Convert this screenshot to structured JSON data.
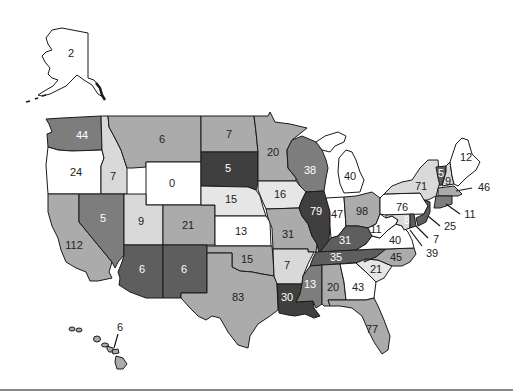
{
  "map": {
    "title": "",
    "palette": {
      "white": "#ffffff",
      "light": "#d9d9d9",
      "medium": "#ababab",
      "dark": "#7d7d7d",
      "darker": "#5e5e5e",
      "darkest": "#3f3f3f",
      "outline": "#1a1a1a"
    },
    "states": {
      "AK": {
        "name": "Alaska",
        "value": "2"
      },
      "HI": {
        "name": "Hawaii",
        "value": "6"
      },
      "WA": {
        "name": "Washington",
        "value": "44"
      },
      "OR": {
        "name": "Oregon",
        "value": "24"
      },
      "CA": {
        "name": "California",
        "value": "112"
      },
      "ID": {
        "name": "Idaho",
        "value": "7"
      },
      "NV": {
        "name": "Nevada",
        "value": "5"
      },
      "MT": {
        "name": "Montana",
        "value": "6"
      },
      "WY": {
        "name": "Wyoming",
        "value": "0"
      },
      "UT": {
        "name": "Utah",
        "value": "9"
      },
      "CO": {
        "name": "Colorado",
        "value": "21"
      },
      "AZ": {
        "name": "Arizona",
        "value": "6"
      },
      "NM": {
        "name": "New Mexico",
        "value": "6"
      },
      "ND": {
        "name": "North Dakota",
        "value": "7"
      },
      "SD": {
        "name": "South Dakota",
        "value": "5"
      },
      "NE": {
        "name": "Nebraska",
        "value": "15"
      },
      "KS": {
        "name": "Kansas",
        "value": "13"
      },
      "OK": {
        "name": "Oklahoma",
        "value": "15"
      },
      "TX": {
        "name": "Texas",
        "value": "83"
      },
      "MN": {
        "name": "Minnesota",
        "value": "20"
      },
      "IA": {
        "name": "Iowa",
        "value": "16"
      },
      "MO": {
        "name": "Missouri",
        "value": "31"
      },
      "AR": {
        "name": "Arkansas",
        "value": "7"
      },
      "LA": {
        "name": "Louisiana",
        "value": "30"
      },
      "WI": {
        "name": "Wisconsin",
        "value": "38"
      },
      "IL": {
        "name": "Illinois",
        "value": "79"
      },
      "MI": {
        "name": "Michigan",
        "value": "40"
      },
      "IN": {
        "name": "Indiana",
        "value": "47"
      },
      "OH": {
        "name": "Ohio",
        "value": "98"
      },
      "KY": {
        "name": "Kentucky",
        "value": "31"
      },
      "TN": {
        "name": "Tennessee",
        "value": "35"
      },
      "MS": {
        "name": "Mississippi",
        "value": "13"
      },
      "AL": {
        "name": "Alabama",
        "value": "20"
      },
      "GA": {
        "name": "Georgia",
        "value": "43"
      },
      "FL": {
        "name": "Florida",
        "value": "77"
      },
      "SC": {
        "name": "South Carolina",
        "value": "21"
      },
      "NC": {
        "name": "North Carolina",
        "value": "45"
      },
      "VA": {
        "name": "Virginia",
        "value": "40"
      },
      "WV": {
        "name": "West Virginia",
        "value": "11"
      },
      "MD": {
        "name": "Maryland",
        "value": "8"
      },
      "DE": {
        "name": "Delaware",
        "value": "7"
      },
      "DC": {
        "name": "District of Columbia",
        "value": "39"
      },
      "PA": {
        "name": "Pennsylvania",
        "value": "76"
      },
      "NJ": {
        "name": "New Jersey",
        "value": "25"
      },
      "NY": {
        "name": "New York",
        "value": "71"
      },
      "CT": {
        "name": "Connecticut",
        "value": "11"
      },
      "MA": {
        "name": "Massachusetts",
        "value": "46"
      },
      "VT": {
        "name": "Vermont",
        "value": "5"
      },
      "NH": {
        "name": "New Hampshire",
        "value": "9"
      },
      "ME": {
        "name": "Maine",
        "value": "12"
      }
    }
  }
}
